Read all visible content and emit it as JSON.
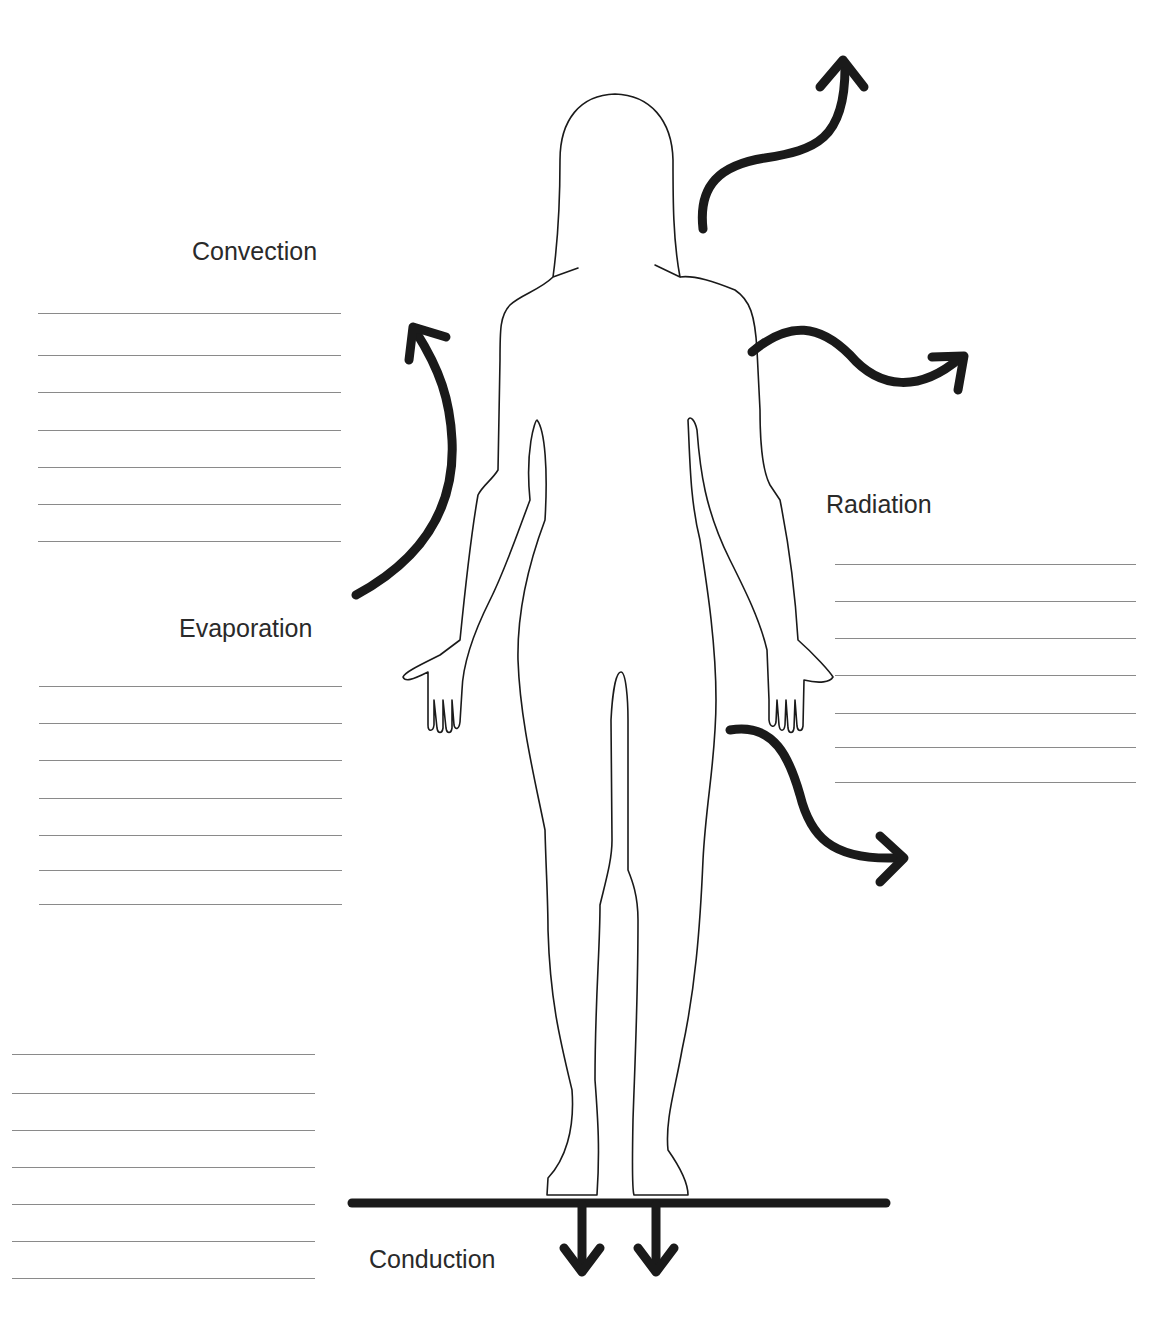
{
  "labels": {
    "convection": "Convection",
    "evaporation": "Evaporation",
    "radiation": "Radiation",
    "conduction": "Conduction"
  },
  "answer_lines": {
    "convection": {
      "count": 7
    },
    "evaporation": {
      "count": 7
    },
    "radiation": {
      "count": 7
    },
    "conduction": {
      "count": 7
    }
  },
  "figure": {
    "arrows": [
      "convection-arrow",
      "evaporation-arrow",
      "radiation-arrow-upper",
      "radiation-arrow-lower",
      "conduction-arrow-left",
      "conduction-arrow-right"
    ]
  },
  "colors": {
    "ink": "#1a1a1a",
    "line": "#8a8a8a",
    "text": "#2a2a2a"
  }
}
